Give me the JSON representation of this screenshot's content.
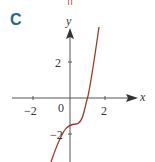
{
  "panel_label": "C",
  "axes": {
    "x_label": "x",
    "y_label": "y"
  },
  "ticks": {
    "x_neg": "−2",
    "x_pos": "2",
    "origin": "0",
    "y_pos": "2",
    "y_neg": "−2"
  },
  "colors": {
    "curve": "#a0382a",
    "axis": "#555555",
    "panel": "#1a6a8a"
  },
  "curve": "cubic with inflection near (0.4, -1.4), x-intercept near 1"
}
